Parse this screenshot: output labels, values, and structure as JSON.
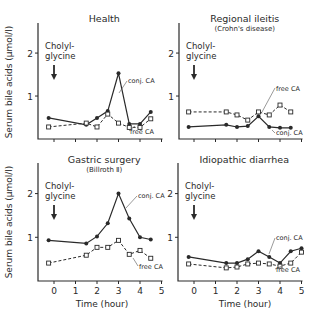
{
  "figure": {
    "ylabel": "Serum bile acids (µmol/l)",
    "xlabel": "Time (hour)",
    "marker_note_line1": "Cholyl-",
    "marker_note_line2": "glycine",
    "marker_icon": "down-arrow-icon"
  },
  "chart_data": [
    {
      "type": "line",
      "title": "Health",
      "subtitle": "",
      "xlabel": "",
      "ylabel": "Serum bile acids (µmol/l)",
      "xlim": [
        -0.4,
        5
      ],
      "ylim": [
        0,
        2.7
      ],
      "yticks": [
        "1",
        "2"
      ],
      "xticks": [
        "0",
        "1",
        "2",
        "3",
        "4",
        "5"
      ],
      "show_xtick_labels": false,
      "x": [
        -0.25,
        1.5,
        2,
        2.5,
        3,
        3.5,
        4,
        4.5
      ],
      "series": [
        {
          "name": "conj. CA",
          "marker": "filled-circle",
          "style": "solid",
          "values": [
            0.49,
            0.33,
            0.49,
            0.65,
            1.53,
            0.35,
            0.35,
            0.63
          ]
        },
        {
          "name": "free CA",
          "marker": "open-square",
          "style": "dashed",
          "values": [
            0.28,
            0.37,
            0.28,
            0.58,
            0.37,
            0.27,
            0.27,
            0.47
          ]
        }
      ],
      "labels": {
        "conj": "conj. CA",
        "free": "free CA"
      }
    },
    {
      "type": "line",
      "title": "Regional ileitis",
      "subtitle": "(Crohn's disease)",
      "xlabel": "",
      "ylabel": "",
      "xlim": [
        -0.4,
        5
      ],
      "ylim": [
        0,
        2.7
      ],
      "yticks": [
        "1",
        "2"
      ],
      "xticks": [
        "0",
        "1",
        "2",
        "3",
        "4",
        "5"
      ],
      "show_xtick_labels": false,
      "x": [
        -0.25,
        1.5,
        2,
        2.5,
        3,
        3.5,
        4,
        4.5
      ],
      "series": [
        {
          "name": "conj. CA",
          "marker": "filled-circle",
          "style": "solid",
          "values": [
            0.28,
            0.33,
            0.28,
            0.3,
            0.53,
            0.28,
            0.26,
            0.26
          ]
        },
        {
          "name": "free CA",
          "marker": "open-square",
          "style": "dashed",
          "values": [
            0.63,
            0.63,
            0.56,
            0.44,
            0.63,
            0.56,
            0.79,
            0.63
          ]
        }
      ],
      "labels": {
        "conj": "conj. CA",
        "free": "free CA"
      }
    },
    {
      "type": "line",
      "title": "Gastric surgery",
      "subtitle": "(Billroth Ⅱ)",
      "xlabel": "Time (hour)",
      "ylabel": "Serum bile acids (µmol/l)",
      "xlim": [
        -0.4,
        5
      ],
      "ylim": [
        0,
        2.7
      ],
      "yticks": [
        "1",
        "2"
      ],
      "xticks": [
        "0",
        "1",
        "2",
        "3",
        "4",
        "5"
      ],
      "show_xtick_labels": true,
      "x": [
        -0.25,
        1.5,
        2,
        2.5,
        3,
        3.5,
        4,
        4.5
      ],
      "series": [
        {
          "name": "conj. CA",
          "marker": "filled-circle",
          "style": "solid",
          "values": [
            0.93,
            0.86,
            1.02,
            1.32,
            2.0,
            1.43,
            1.0,
            0.95
          ]
        },
        {
          "name": "free CA",
          "marker": "open-square",
          "style": "dashed",
          "values": [
            0.41,
            0.59,
            0.77,
            0.77,
            0.93,
            0.61,
            0.7,
            0.52
          ]
        }
      ],
      "labels": {
        "conj": "conj. CA",
        "free": "free CA"
      }
    },
    {
      "type": "line",
      "title": "Idiopathic diarrhea",
      "subtitle": "",
      "xlabel": "Time (hour)",
      "ylabel": "",
      "xlim": [
        -0.4,
        5
      ],
      "ylim": [
        0,
        2.7
      ],
      "yticks": [
        "1",
        "2"
      ],
      "xticks": [
        "0",
        "1",
        "2",
        "3",
        "4",
        "5"
      ],
      "show_xtick_labels": true,
      "x": [
        -0.25,
        1.5,
        2,
        2.5,
        3,
        3.5,
        4,
        4.5,
        5
      ],
      "series": [
        {
          "name": "conj. CA",
          "marker": "filled-circle",
          "style": "solid",
          "values": [
            0.55,
            0.41,
            0.41,
            0.5,
            0.68,
            0.55,
            0.41,
            0.68,
            0.75
          ]
        },
        {
          "name": "free CA",
          "marker": "open-square",
          "style": "dashed",
          "values": [
            0.39,
            0.3,
            0.32,
            0.39,
            0.41,
            0.39,
            0.34,
            0.41,
            0.66
          ]
        }
      ],
      "labels": {
        "conj": "conj. CA",
        "free": "free CA"
      }
    }
  ]
}
